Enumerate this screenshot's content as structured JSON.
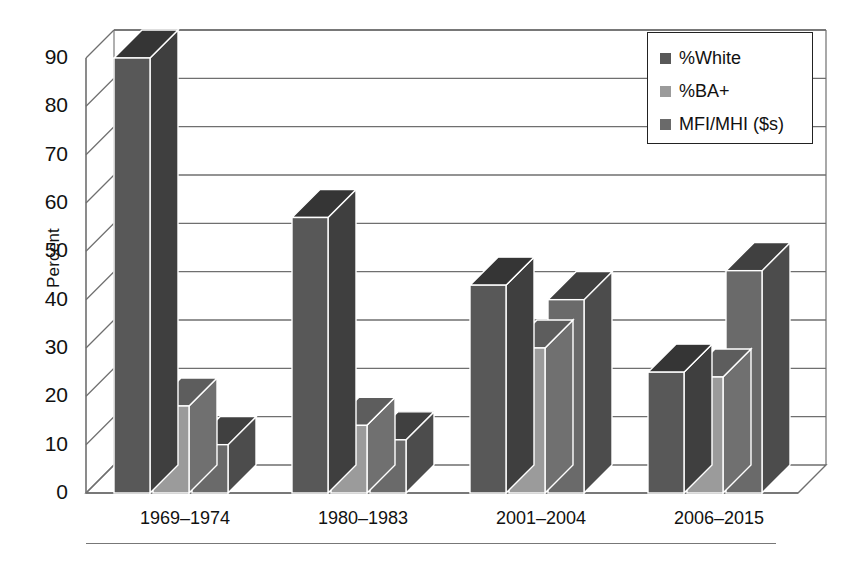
{
  "chart_data": {
    "type": "bar",
    "title": "",
    "subtitle": "",
    "xlabel": "",
    "ylabel": "Percent",
    "ylim": [
      0,
      90
    ],
    "ytick_step": 10,
    "yticks": [
      90,
      80,
      70,
      60,
      50,
      40,
      30,
      20,
      10,
      0
    ],
    "categories": [
      "1969–1974",
      "1980–1983",
      "2001–2004",
      "2006–2015"
    ],
    "series": [
      {
        "name": "%White",
        "color": "#585858",
        "values": [
          90,
          57,
          43,
          25
        ]
      },
      {
        "name": "%BA+",
        "color": "#9b9b9b",
        "values": [
          18,
          14,
          30,
          24
        ]
      },
      {
        "name": "MFI/MHI ($s)",
        "color": "#6a6a6a",
        "values": [
          10,
          11,
          40,
          46
        ]
      }
    ],
    "grid": true,
    "grid_axis": "y",
    "style": "3d-column",
    "legend_position": "top-right",
    "annotations": []
  },
  "legend": {
    "items": [
      {
        "label": "%White",
        "swatch": "#585858"
      },
      {
        "label": "%BA+",
        "swatch": "#9b9b9b"
      },
      {
        "label": "MFI/MHI ($s)",
        "swatch": "#6a6a6a"
      }
    ]
  },
  "axes": {
    "y_title": "Percent",
    "y_ticks": [
      "90",
      "80",
      "70",
      "60",
      "50",
      "40",
      "30",
      "20",
      "10",
      "0"
    ],
    "x_ticks": [
      "1969–1974",
      "1980–1983",
      "2001–2004",
      "2006–2015"
    ]
  },
  "colors": {
    "series_1": "#585858",
    "series_2": "#9b9b9b",
    "series_3": "#6a6a6a",
    "axis_line": "#6f6f6f",
    "grid_line": "#6f6f6f",
    "text": "#111111",
    "background": "#ffffff"
  }
}
